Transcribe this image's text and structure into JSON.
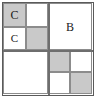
{
  "figure": {
    "name": "quadtree-subdivision-diagram",
    "type": "recursive-grid",
    "width": 97,
    "height": 99,
    "colors": {
      "shaded": "#c9c9c9",
      "empty": "#ffffff",
      "outer_border": "#5a5a5a",
      "inner_line": "#8c8c8c",
      "divider": "#6e6e6e",
      "label_text": "#1a1a1a"
    },
    "quadrants": [
      {
        "id": "top-left",
        "subdivided": true,
        "cells": [
          {
            "id": "tl-nw",
            "shaded": true,
            "label": "C"
          },
          {
            "id": "tl-ne",
            "shaded": false,
            "label": ""
          },
          {
            "id": "tl-sw",
            "shaded": false,
            "label": "C"
          },
          {
            "id": "tl-se",
            "shaded": true,
            "label": ""
          }
        ]
      },
      {
        "id": "top-right",
        "subdivided": false,
        "cells": [
          {
            "id": "tr",
            "shaded": false,
            "label": "B"
          }
        ]
      },
      {
        "id": "bottom-left",
        "subdivided": false,
        "cells": [
          {
            "id": "bl",
            "shaded": false,
            "label": ""
          }
        ]
      },
      {
        "id": "bottom-right",
        "subdivided": true,
        "cells": [
          {
            "id": "br-nw",
            "shaded": true,
            "label": ""
          },
          {
            "id": "br-ne",
            "shaded": false,
            "label": ""
          },
          {
            "id": "br-sw",
            "shaded": false,
            "label": ""
          },
          {
            "id": "br-se",
            "shaded": true,
            "label": ""
          }
        ]
      }
    ]
  }
}
